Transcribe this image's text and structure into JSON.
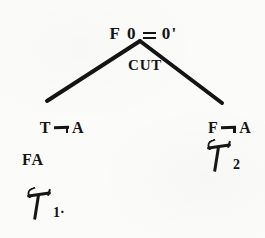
{
  "figure": {
    "kind": "proof-tree",
    "ink_color": "#141414",
    "paper_color": "#fbfbfa"
  },
  "root": {
    "name": "root-sequent",
    "sign": "F",
    "left_term": "0",
    "relation": "=",
    "right_term": "0'",
    "full_text": "F 0 = 0'"
  },
  "rule": {
    "label": "CUT"
  },
  "branches": {
    "left": {
      "sign": "T",
      "connective": "¬",
      "atom": "A",
      "full_text": "T ¬ A",
      "side_label": "FA",
      "derivation_symbol": "τ",
      "derivation_subscript": "1",
      "derivation_trailing": "·",
      "derivation_text": "τ1·"
    },
    "right": {
      "sign": "F",
      "connective": "¬",
      "atom": "A",
      "full_text": "F ¬ A",
      "derivation_symbol": "τ",
      "derivation_subscript": "2",
      "derivation_text": "τ2"
    }
  },
  "edges": {
    "apex": {
      "x": 140,
      "y": 41
    },
    "left_end": {
      "x": 47,
      "y": 101
    },
    "right_end": {
      "x": 222,
      "y": 103
    },
    "stroke_width": 4,
    "stroke_color": "#141414"
  }
}
